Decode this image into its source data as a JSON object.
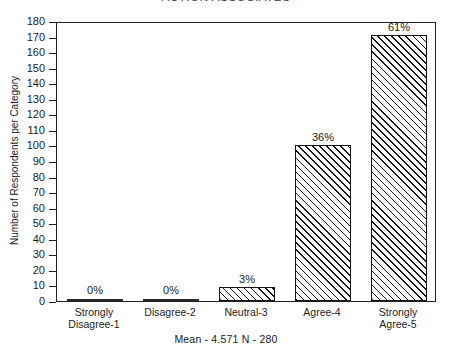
{
  "chart_data": {
    "type": "bar",
    "title": "ACTION ASSOCIATES",
    "xlabel": "",
    "ylabel": "Number of Respondents per Category",
    "categories": [
      "Strongly\nDisagree-1",
      "Disagree-2",
      "Neutral-3",
      "Agree-4",
      "Strongly\nAgree-5"
    ],
    "category_lines": [
      [
        "Strongly",
        "Disagree-1"
      ],
      [
        "Disagree-2"
      ],
      [
        "Neutral-3"
      ],
      [
        "Agree-4"
      ],
      [
        "Strongly",
        "Agree-5"
      ]
    ],
    "values": [
      1,
      1,
      9,
      100,
      171
    ],
    "data_labels": [
      "0%",
      "0%",
      "3%",
      "36%",
      "61%"
    ],
    "ylim": [
      0,
      180
    ],
    "ytick_step": 10,
    "yticks": [
      180,
      170,
      160,
      150,
      140,
      130,
      120,
      110,
      100,
      90,
      80,
      70,
      60,
      50,
      40,
      30,
      20,
      10,
      0
    ],
    "ytick_labels": [
      "180",
      "170",
      "160",
      "150",
      "140",
      "130",
      "120",
      "110",
      "100",
      "90",
      "80",
      "70",
      "60",
      "50",
      "40",
      "30",
      "20",
      "10",
      "0"
    ],
    "grid": false,
    "legend": null,
    "bar_fill": "diagonal-hatch",
    "caption": "Mean - 4.571  N - 280",
    "annotations": {
      "mean": "4.571",
      "n": "280"
    },
    "colors": {
      "axis": "#202020",
      "bar_outline": "#141414",
      "bar_hatch": "#141414",
      "background": "#ffffff",
      "text": "#1a1a1a"
    }
  }
}
